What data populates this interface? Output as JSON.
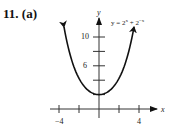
{
  "problem": {
    "number": "11.",
    "part": "(a)"
  },
  "chart_data": {
    "type": "line",
    "title": "",
    "annotation": "y = 2^x + 2^-x",
    "equation_display": {
      "base": "y = 2",
      "exp1": "x",
      "mid": " + 2",
      "exp2": "−x"
    },
    "xlabel": "x",
    "ylabel": "y",
    "x_ticks": [
      -4,
      -2,
      0,
      2,
      4
    ],
    "x_tick_labels": [
      "−4",
      "4"
    ],
    "y_ticks": [
      2,
      4,
      6,
      8,
      10
    ],
    "y_tick_labels": [
      "6",
      "10"
    ],
    "xlim": [
      -4.5,
      4.5
    ],
    "ylim": [
      0,
      12
    ],
    "grid": false,
    "series": [
      {
        "name": "y = 2^x + 2^-x",
        "x": [
          -3.5,
          -3,
          -2.5,
          -2,
          -1.5,
          -1,
          -0.5,
          0,
          0.5,
          1,
          1.5,
          2,
          2.5,
          3,
          3.5
        ],
        "y": [
          11.4,
          8.13,
          5.83,
          4.25,
          3.18,
          2.5,
          2.12,
          2,
          2.12,
          2.5,
          3.18,
          4.25,
          5.83,
          8.13,
          11.4
        ]
      }
    ],
    "color": "#111111"
  }
}
